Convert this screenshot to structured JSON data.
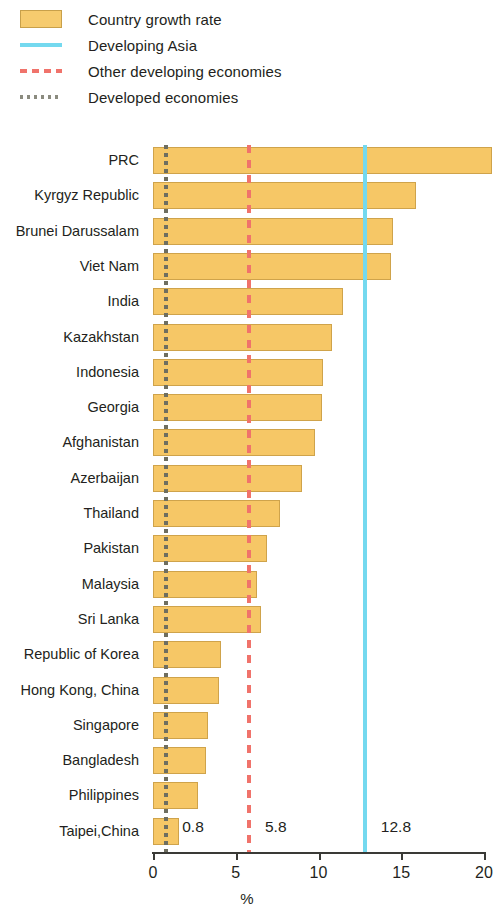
{
  "legend": {
    "items": [
      {
        "label": "Country growth rate",
        "key": "filled-square-swatch",
        "color": "#f6cb6e"
      },
      {
        "label": "Developing Asia",
        "key": "solid-line-swatch",
        "color": "#74d9ef"
      },
      {
        "label": "Other developing economies",
        "key": "dashed-line-swatch",
        "color": "#f0736b"
      },
      {
        "label": "Developed economies",
        "key": "dotted-line-swatch",
        "color": "#8b8b7f"
      }
    ]
  },
  "axis": {
    "x_title": "%",
    "ticks": [
      "0",
      "5",
      "10",
      "15",
      "20"
    ],
    "tick_values": [
      0,
      5,
      10,
      15,
      20
    ]
  },
  "reference_notes": [
    {
      "label": "0.8",
      "value": 0.8
    },
    {
      "label": "5.8",
      "value": 5.8
    },
    {
      "label": "12.8",
      "value": 12.8
    }
  ],
  "chart_data": {
    "type": "bar",
    "orientation": "horizontal",
    "title": "",
    "xlabel": "%",
    "ylabel": "",
    "xlim": [
      0,
      20
    ],
    "grid": false,
    "legend_position": "top-left",
    "categories": [
      "PRC",
      "Kyrgyz Republic",
      "Brunei Darussalam",
      "Viet Nam",
      "India",
      "Kazakhstan",
      "Indonesia",
      "Georgia",
      "Afghanistan",
      "Azerbaijan",
      "Thailand",
      "Pakistan",
      "Malaysia",
      "Sri Lanka",
      "Republic of Korea",
      "Hong Kong, China",
      "Singapore",
      "Bangladesh",
      "Philippines",
      "Taipei,China"
    ],
    "values": [
      20.5,
      15.9,
      14.5,
      14.4,
      11.5,
      10.8,
      10.3,
      10.2,
      9.8,
      9.0,
      7.7,
      6.9,
      6.3,
      6.5,
      4.1,
      4.0,
      3.3,
      3.2,
      2.7,
      1.6
    ],
    "series": [
      {
        "name": "Country growth rate",
        "color": "#f6c766",
        "values": [
          20.5,
          15.9,
          14.5,
          14.4,
          11.5,
          10.8,
          10.3,
          10.2,
          9.8,
          9.0,
          7.7,
          6.9,
          6.3,
          6.5,
          4.1,
          4.0,
          3.3,
          3.2,
          2.7,
          1.6
        ]
      }
    ],
    "reference_lines": [
      {
        "name": "Developed economies",
        "value": 0.8,
        "style": "dotted",
        "color": "#6e6e60"
      },
      {
        "name": "Other developing economies",
        "value": 5.8,
        "style": "dashed",
        "color": "#f0736b"
      },
      {
        "name": "Developing Asia",
        "value": 12.8,
        "style": "solid",
        "color": "#74d9ef"
      }
    ]
  }
}
